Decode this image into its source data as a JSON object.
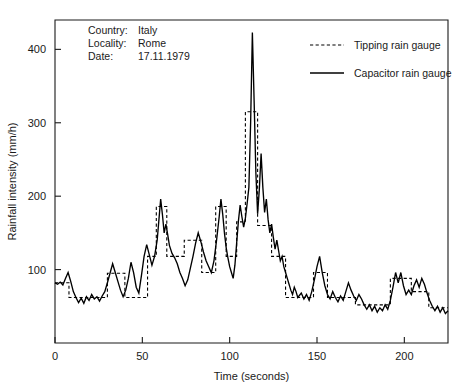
{
  "chart_data": {
    "type": "line",
    "title": "",
    "xlabel": "Time (seconds)",
    "ylabel": "Rainfall intensity (mm/h)",
    "xlim": [
      0,
      225
    ],
    "ylim": [
      0,
      440
    ],
    "xticks": [
      0,
      50,
      100,
      150,
      200
    ],
    "xticklabels": [
      "0",
      "50",
      "100",
      "150",
      "200"
    ],
    "yticks": [
      100,
      200,
      300,
      400
    ],
    "yticklabels": [
      "100",
      "200",
      "300",
      "400"
    ],
    "grid": false,
    "legend_position": "upper-right-inside",
    "annotation": {
      "fields": [
        {
          "label": "Country:",
          "value": "Italy"
        },
        {
          "label": "Locality:",
          "value": "Rome"
        },
        {
          "label": "Date:",
          "value": "17.11.1979"
        }
      ]
    },
    "legend": [
      {
        "name": "Tipping rain gauge",
        "style": "dashed"
      },
      {
        "name": "Capacitor rain gauge",
        "style": "solid"
      }
    ],
    "series": [
      {
        "name": "Capacitor rain gauge",
        "style": "solid",
        "points": [
          [
            0,
            82
          ],
          [
            1.5,
            80
          ],
          [
            3,
            83
          ],
          [
            4.5,
            79
          ],
          [
            6,
            88
          ],
          [
            7.5,
            96
          ],
          [
            9,
            84
          ],
          [
            10.5,
            70
          ],
          [
            12,
            62
          ],
          [
            13.5,
            55
          ],
          [
            15,
            61
          ],
          [
            16.5,
            54
          ],
          [
            18,
            63
          ],
          [
            19.5,
            58
          ],
          [
            21,
            66
          ],
          [
            22.5,
            60
          ],
          [
            24,
            63
          ],
          [
            25.5,
            57
          ],
          [
            27,
            64
          ],
          [
            28.5,
            70
          ],
          [
            30,
            82
          ],
          [
            31.5,
            95
          ],
          [
            33,
            108
          ],
          [
            34.5,
            96
          ],
          [
            36,
            84
          ],
          [
            37.5,
            72
          ],
          [
            39,
            63
          ],
          [
            40.5,
            72
          ],
          [
            42,
            88
          ],
          [
            43.5,
            110
          ],
          [
            45,
            96
          ],
          [
            46.5,
            76
          ],
          [
            48,
            68
          ],
          [
            49.5,
            92
          ],
          [
            51,
            118
          ],
          [
            52.5,
            134
          ],
          [
            54,
            120
          ],
          [
            55.5,
            106
          ],
          [
            57,
            118
          ],
          [
            58.5,
            140
          ],
          [
            59.5,
            168
          ],
          [
            60.5,
            196
          ],
          [
            61.5,
            175
          ],
          [
            62.5,
            150
          ],
          [
            63.5,
            162
          ],
          [
            64.5,
            148
          ],
          [
            65.5,
            133
          ],
          [
            67,
            122
          ],
          [
            68.5,
            116
          ],
          [
            70,
            108
          ],
          [
            71.5,
            96
          ],
          [
            73,
            88
          ],
          [
            74.5,
            78
          ],
          [
            76,
            86
          ],
          [
            77.5,
            102
          ],
          [
            79,
            118
          ],
          [
            80.5,
            136
          ],
          [
            82,
            150
          ],
          [
            83.5,
            138
          ],
          [
            85,
            124
          ],
          [
            86.5,
            112
          ],
          [
            88,
            104
          ],
          [
            89.5,
            96
          ],
          [
            91,
            112
          ],
          [
            92.5,
            140
          ],
          [
            94,
            172
          ],
          [
            95,
            196
          ],
          [
            96,
            176
          ],
          [
            97,
            150
          ],
          [
            98,
            130
          ],
          [
            99,
            116
          ],
          [
            100,
            104
          ],
          [
            101,
            96
          ],
          [
            102,
            88
          ],
          [
            103,
            106
          ],
          [
            104,
            136
          ],
          [
            105,
            166
          ],
          [
            106,
            188
          ],
          [
            107,
            172
          ],
          [
            108,
            158
          ],
          [
            109,
            170
          ],
          [
            110,
            190
          ],
          [
            111,
            212
          ],
          [
            112,
            300
          ],
          [
            113,
            423
          ],
          [
            114,
            330
          ],
          [
            115,
            232
          ],
          [
            116,
            176
          ],
          [
            117,
            210
          ],
          [
            118,
            258
          ],
          [
            119,
            212
          ],
          [
            120,
            178
          ],
          [
            121,
            196
          ],
          [
            122,
            168
          ],
          [
            123,
            150
          ],
          [
            124,
            162
          ],
          [
            125,
            144
          ],
          [
            126,
            128
          ],
          [
            127,
            140
          ],
          [
            128,
            126
          ],
          [
            129,
            112
          ],
          [
            130,
            118
          ],
          [
            131,
            104
          ],
          [
            132,
            96
          ],
          [
            133,
            88
          ],
          [
            134,
            80
          ],
          [
            135,
            72
          ],
          [
            136,
            66
          ],
          [
            137,
            76
          ],
          [
            138,
            70
          ],
          [
            139,
            62
          ],
          [
            141,
            68
          ],
          [
            142.5,
            60
          ],
          [
            144,
            66
          ],
          [
            145.5,
            58
          ],
          [
            147,
            70
          ],
          [
            148.5,
            86
          ],
          [
            150,
            104
          ],
          [
            151.5,
            118
          ],
          [
            153,
            96
          ],
          [
            154.5,
            78
          ],
          [
            156,
            66
          ],
          [
            157.5,
            60
          ],
          [
            159,
            70
          ],
          [
            160.5,
            62
          ],
          [
            162,
            56
          ],
          [
            163.5,
            64
          ],
          [
            165,
            58
          ],
          [
            166.5,
            70
          ],
          [
            168,
            82
          ],
          [
            169.5,
            72
          ],
          [
            171,
            64
          ],
          [
            172.5,
            58
          ],
          [
            174,
            66
          ],
          [
            175.5,
            60
          ],
          [
            177,
            52
          ],
          [
            178.5,
            46
          ],
          [
            180,
            52
          ],
          [
            181.5,
            44
          ],
          [
            183,
            50
          ],
          [
            184.5,
            42
          ],
          [
            186,
            48
          ],
          [
            187.5,
            44
          ],
          [
            189,
            52
          ],
          [
            190.5,
            46
          ],
          [
            192,
            58
          ],
          [
            193.5,
            76
          ],
          [
            195,
            96
          ],
          [
            196.5,
            82
          ],
          [
            198,
            96
          ],
          [
            199.5,
            78
          ],
          [
            201,
            66
          ],
          [
            202.5,
            72
          ],
          [
            204,
            66
          ],
          [
            205.5,
            78
          ],
          [
            207,
            86
          ],
          [
            208.5,
            76
          ],
          [
            210,
            88
          ],
          [
            211.5,
            80
          ],
          [
            213,
            68
          ],
          [
            214.5,
            58
          ],
          [
            216,
            50
          ],
          [
            217.5,
            44
          ],
          [
            219,
            50
          ],
          [
            220.5,
            42
          ],
          [
            222,
            48
          ],
          [
            223.5,
            40
          ],
          [
            225,
            44
          ]
        ]
      },
      {
        "name": "Tipping rain gauge",
        "style": "dashed",
        "steps": [
          [
            0,
            82
          ],
          [
            8,
            82
          ],
          [
            8,
            62
          ],
          [
            30,
            62
          ],
          [
            30,
            95
          ],
          [
            40,
            95
          ],
          [
            40,
            62
          ],
          [
            53,
            62
          ],
          [
            53,
            118
          ],
          [
            58,
            118
          ],
          [
            58,
            186
          ],
          [
            64,
            186
          ],
          [
            64,
            118
          ],
          [
            74,
            118
          ],
          [
            74,
            140
          ],
          [
            84,
            140
          ],
          [
            84,
            96
          ],
          [
            92,
            96
          ],
          [
            92,
            186
          ],
          [
            98,
            186
          ],
          [
            98,
            118
          ],
          [
            104,
            118
          ],
          [
            104,
            165
          ],
          [
            109,
            165
          ],
          [
            109,
            315
          ],
          [
            116,
            315
          ],
          [
            116,
            160
          ],
          [
            124,
            160
          ],
          [
            124,
            118
          ],
          [
            132,
            118
          ],
          [
            132,
            62
          ],
          [
            148,
            62
          ],
          [
            148,
            96
          ],
          [
            156,
            96
          ],
          [
            156,
            62
          ],
          [
            172,
            62
          ],
          [
            172,
            52
          ],
          [
            192,
            52
          ],
          [
            192,
            88
          ],
          [
            204,
            88
          ],
          [
            204,
            70
          ],
          [
            214,
            70
          ],
          [
            214,
            48
          ],
          [
            225,
            48
          ]
        ]
      }
    ]
  }
}
